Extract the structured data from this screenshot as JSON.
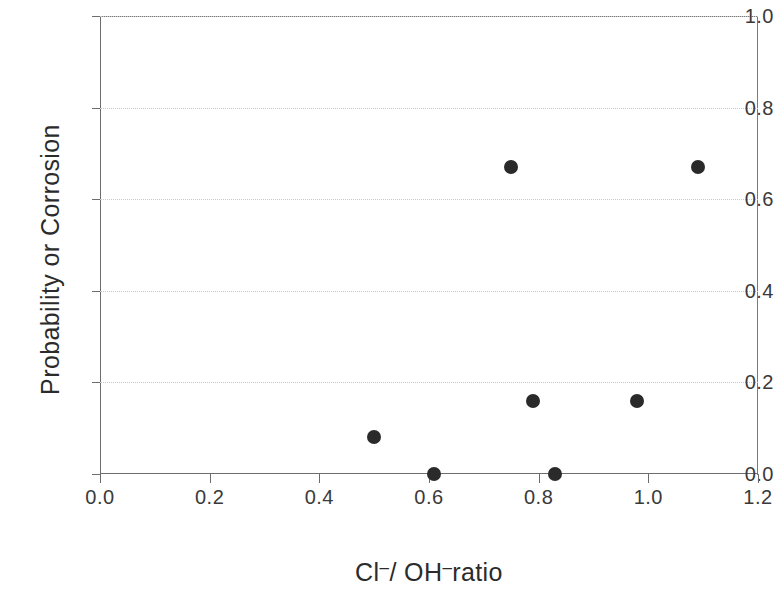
{
  "chart_data": {
    "type": "scatter",
    "title": "",
    "xlabel": "Cl⁻/ OH⁻ratio",
    "xlabel_parts": {
      "a": "Cl",
      "sup1": "–",
      "b": "/ OH",
      "sup2": "–",
      "c": "ratio"
    },
    "ylabel": "Probability or Corrosion",
    "xlim": [
      0.0,
      1.2
    ],
    "ylim": [
      0.0,
      1.0
    ],
    "xticks": [
      "0.0",
      "0.2",
      "0.4",
      "0.6",
      "0.8",
      "1.0",
      "1.2"
    ],
    "xtick_values": [
      0.0,
      0.2,
      0.4,
      0.6,
      0.8,
      1.0,
      1.2
    ],
    "yticks": [
      "0.0",
      "0.2",
      "0.4",
      "0.6",
      "0.8",
      "1.0"
    ],
    "ytick_values": [
      0.0,
      0.2,
      0.4,
      0.6,
      0.8,
      1.0
    ],
    "grid": "horizontal",
    "legend": "none",
    "marker": "filled-circle",
    "marker_color": "#2a2a2a",
    "axis_color": "#6d6d6d",
    "grid_color": "#c9c9c9",
    "points": [
      {
        "x": 0.5,
        "y": 0.08
      },
      {
        "x": 0.61,
        "y": 0.0
      },
      {
        "x": 0.75,
        "y": 0.67
      },
      {
        "x": 0.79,
        "y": 0.16
      },
      {
        "x": 0.83,
        "y": 0.0
      },
      {
        "x": 0.98,
        "y": 0.16
      },
      {
        "x": 1.09,
        "y": 0.67
      }
    ]
  }
}
